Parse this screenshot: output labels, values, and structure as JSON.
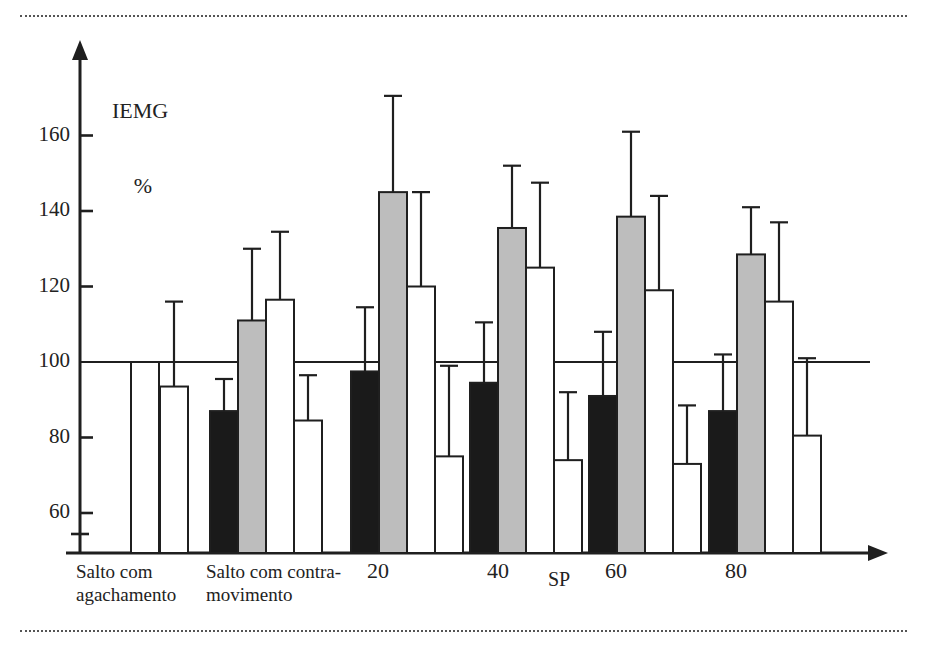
{
  "figure": {
    "background": "#ffffff",
    "ink_color": "#1f1f1f",
    "rule_top": "dotted-rule-top",
    "rule_bottom": "dotted-rule-bottom"
  },
  "axes": {
    "y_title_line1": "IEMG",
    "y_title_line2": "%",
    "x_title": "SP",
    "y_ticks": [
      "160",
      "140",
      "120",
      "100",
      "80",
      "60"
    ],
    "x_group_labels": [
      {
        "line1": "Salto com",
        "line2": "agachamento"
      },
      {
        "line1": "Salto com contra-",
        "line2": "movimento"
      },
      {
        "line1": "20",
        "line2": ""
      },
      {
        "line1": "40",
        "line2": ""
      },
      {
        "line1": "60",
        "line2": ""
      },
      {
        "line1": "80",
        "line2": ""
      }
    ]
  },
  "legend_colors": {
    "series_black": "#1a1a1a",
    "series_gray": "#bdbdbd",
    "series_white": "#ffffff"
  },
  "chart_data": {
    "type": "bar",
    "title": "",
    "subtitle": "",
    "xlabel": "SP",
    "ylabel": "IEMG %",
    "ylim": [
      49,
      178
    ],
    "ytick_values": [
      60,
      80,
      100,
      120,
      140,
      160
    ],
    "grid": false,
    "legend": "none",
    "reference_line": 100,
    "error_bars": "upper-only",
    "categories": [
      "Salto com agachamento",
      "Salto com contra-movimento",
      "20",
      "40",
      "60",
      "80"
    ],
    "series": [
      {
        "name": "series-black",
        "fill": "#1a1a1a",
        "values": [
          null,
          87.0,
          97.5,
          94.5,
          91.0,
          87.0
        ],
        "errors_upper": [
          null,
          95.5,
          114.5,
          110.5,
          108.0,
          102.0
        ]
      },
      {
        "name": "series-gray",
        "fill": "#bdbdbd",
        "values": [
          null,
          111.0,
          145.0,
          135.5,
          138.5,
          128.5
        ],
        "errors_upper": [
          null,
          130.0,
          170.5,
          152.0,
          161.0,
          141.0
        ]
      },
      {
        "name": "series-white-1",
        "fill": "#ffffff",
        "values": [
          100.0,
          116.5,
          120.0,
          125.0,
          119.0,
          116.0
        ],
        "errors_upper": [
          null,
          134.5,
          145.0,
          147.5,
          144.0,
          137.0
        ]
      },
      {
        "name": "series-white-2",
        "fill": "#ffffff",
        "values": [
          93.5,
          84.5,
          75.0,
          74.0,
          73.0,
          80.5
        ],
        "errors_upper": [
          116.0,
          96.5,
          99.0,
          92.0,
          88.5,
          101.0
        ]
      }
    ]
  }
}
